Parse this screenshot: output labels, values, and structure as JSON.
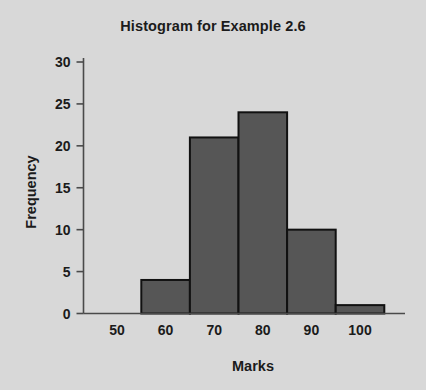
{
  "chart_data": {
    "type": "bar",
    "title": "Histogram for Example 2.6",
    "xlabel": "Marks",
    "ylabel": "Frequency",
    "categories": [
      "55-65",
      "65-75",
      "75-85",
      "85-95",
      "95-105"
    ],
    "bin_edges": [
      55,
      65,
      75,
      85,
      95,
      105
    ],
    "values": [
      4,
      21,
      24,
      10,
      1
    ],
    "x_tick_labels": [
      "50",
      "60",
      "70",
      "80",
      "90",
      "100"
    ],
    "x_tick_values": [
      50,
      60,
      70,
      80,
      90,
      100
    ],
    "y_tick_labels": [
      "0",
      "5",
      "10",
      "15",
      "20",
      "25",
      "30"
    ],
    "y_tick_values": [
      0,
      5,
      10,
      15,
      20,
      25,
      30
    ],
    "xlim": [
      45,
      110
    ],
    "ylim": [
      0,
      31
    ],
    "grid": false,
    "legend": "none",
    "colors": {
      "background": "#d8d8d8",
      "bar_fill": "#565656",
      "bar_stroke": "#111111",
      "axis": "#4a4a4a",
      "text": "#1b1b1b"
    }
  }
}
